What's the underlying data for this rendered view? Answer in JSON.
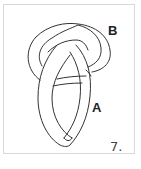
{
  "diagram": {
    "type": "knot-tying-step",
    "step_number": "7.",
    "labels": {
      "a": "A",
      "b": "B"
    },
    "colors": {
      "stroke": "#333333",
      "frame": "#d8d8d8",
      "background": "#ffffff"
    }
  }
}
